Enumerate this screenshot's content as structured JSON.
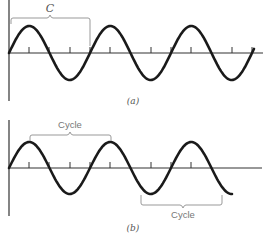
{
  "figure": {
    "panels": [
      {
        "id": "a",
        "caption": "(a)",
        "bracket_label": "C",
        "description": "Sine wave starting at origin, about 3 cycles, with bracket spanning one cycle labeled C"
      },
      {
        "id": "b",
        "caption": "(b)",
        "bracket_label_top": "Cycle",
        "bracket_label_bottom": "Cycle",
        "description": "Sine wave with one cycle bracketed peak-to-peak above the axis and another bracketed trough-to-trough below"
      }
    ],
    "colors": {
      "curve": "#1a1a1a",
      "axis": "#333333",
      "bracket": "#999999",
      "label": "#666666"
    }
  }
}
